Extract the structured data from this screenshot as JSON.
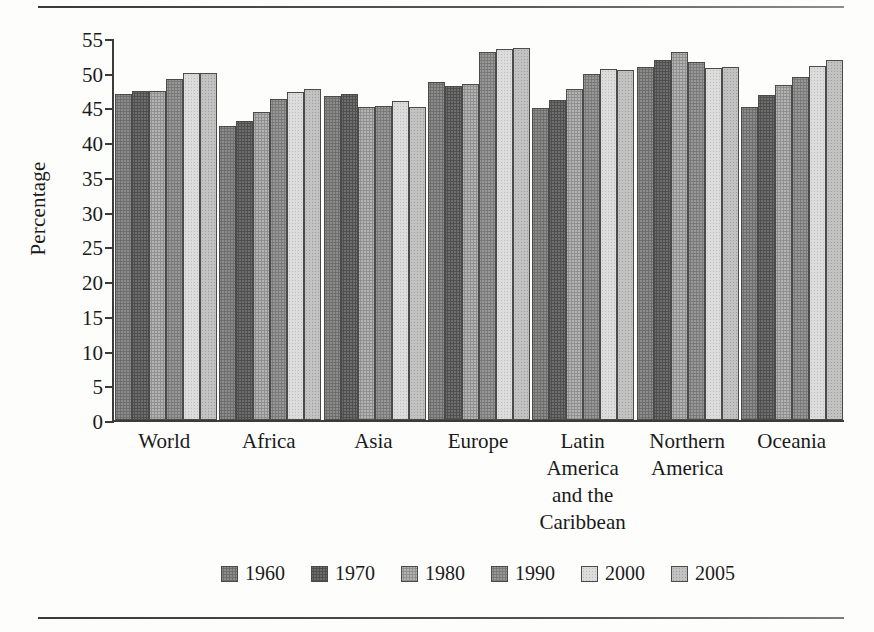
{
  "chart_data": {
    "type": "bar",
    "title": "",
    "xlabel": "",
    "ylabel": "Percentage",
    "ylim": [
      0,
      55
    ],
    "yticks": [
      0,
      5,
      10,
      15,
      20,
      25,
      30,
      35,
      40,
      45,
      50,
      55
    ],
    "grid": false,
    "legend_position": "bottom",
    "categories": [
      "World",
      "Africa",
      "Asia",
      "Europe",
      "Latin America and the Caribbean",
      "Northern America",
      "Oceania"
    ],
    "category_lines": [
      [
        "World"
      ],
      [
        "Africa"
      ],
      [
        "Asia"
      ],
      [
        "Europe"
      ],
      [
        "Latin",
        "America",
        "and the",
        "Caribbean"
      ],
      [
        "Northern",
        "America"
      ],
      [
        "Oceania"
      ]
    ],
    "series": [
      {
        "name": "1960",
        "color": "#8d8d8d",
        "values": [
          47.0,
          42.4,
          46.7,
          48.6,
          44.9,
          50.8,
          45.0
        ]
      },
      {
        "name": "1970",
        "color": "#6f6f6f",
        "values": [
          47.4,
          43.1,
          47.0,
          48.1,
          46.1,
          51.8,
          46.8
        ]
      },
      {
        "name": "1980",
        "color": "#b4b4b4",
        "values": [
          47.3,
          44.3,
          45.0,
          48.4,
          47.6,
          53.0,
          48.3
        ]
      },
      {
        "name": "1990",
        "color": "#999999",
        "values": [
          49.1,
          46.2,
          45.2,
          53.0,
          49.8,
          51.6,
          49.4
        ]
      },
      {
        "name": "2000",
        "color": "#dcdcdc",
        "values": [
          50.0,
          47.2,
          45.9,
          53.4,
          50.5,
          50.7,
          51.0
        ]
      },
      {
        "name": "2005",
        "color": "#c2c2c2",
        "values": [
          50.0,
          47.6,
          45.0,
          53.6,
          50.4,
          50.8,
          51.9
        ]
      }
    ]
  },
  "legend": {
    "entries": [
      "1960",
      "1970",
      "1980",
      "1990",
      "2000",
      "2005"
    ]
  }
}
